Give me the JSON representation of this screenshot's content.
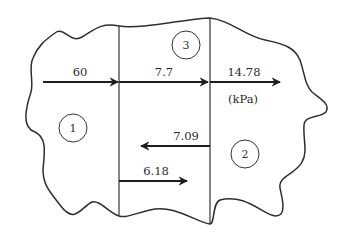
{
  "diagram": {
    "unit_label": "(kPa)",
    "regions": [
      {
        "id": "1",
        "label": "1"
      },
      {
        "id": "2",
        "label": "2"
      },
      {
        "id": "3",
        "label": "3"
      }
    ],
    "arrows": [
      {
        "id": "a60",
        "label": "60",
        "direction": "right"
      },
      {
        "id": "a77",
        "label": "7.7",
        "direction": "right"
      },
      {
        "id": "a1478",
        "label": "14.78",
        "direction": "right"
      },
      {
        "id": "a709",
        "label": "7.09",
        "direction": "left"
      },
      {
        "id": "a618",
        "label": "6.18",
        "direction": "right"
      }
    ]
  }
}
